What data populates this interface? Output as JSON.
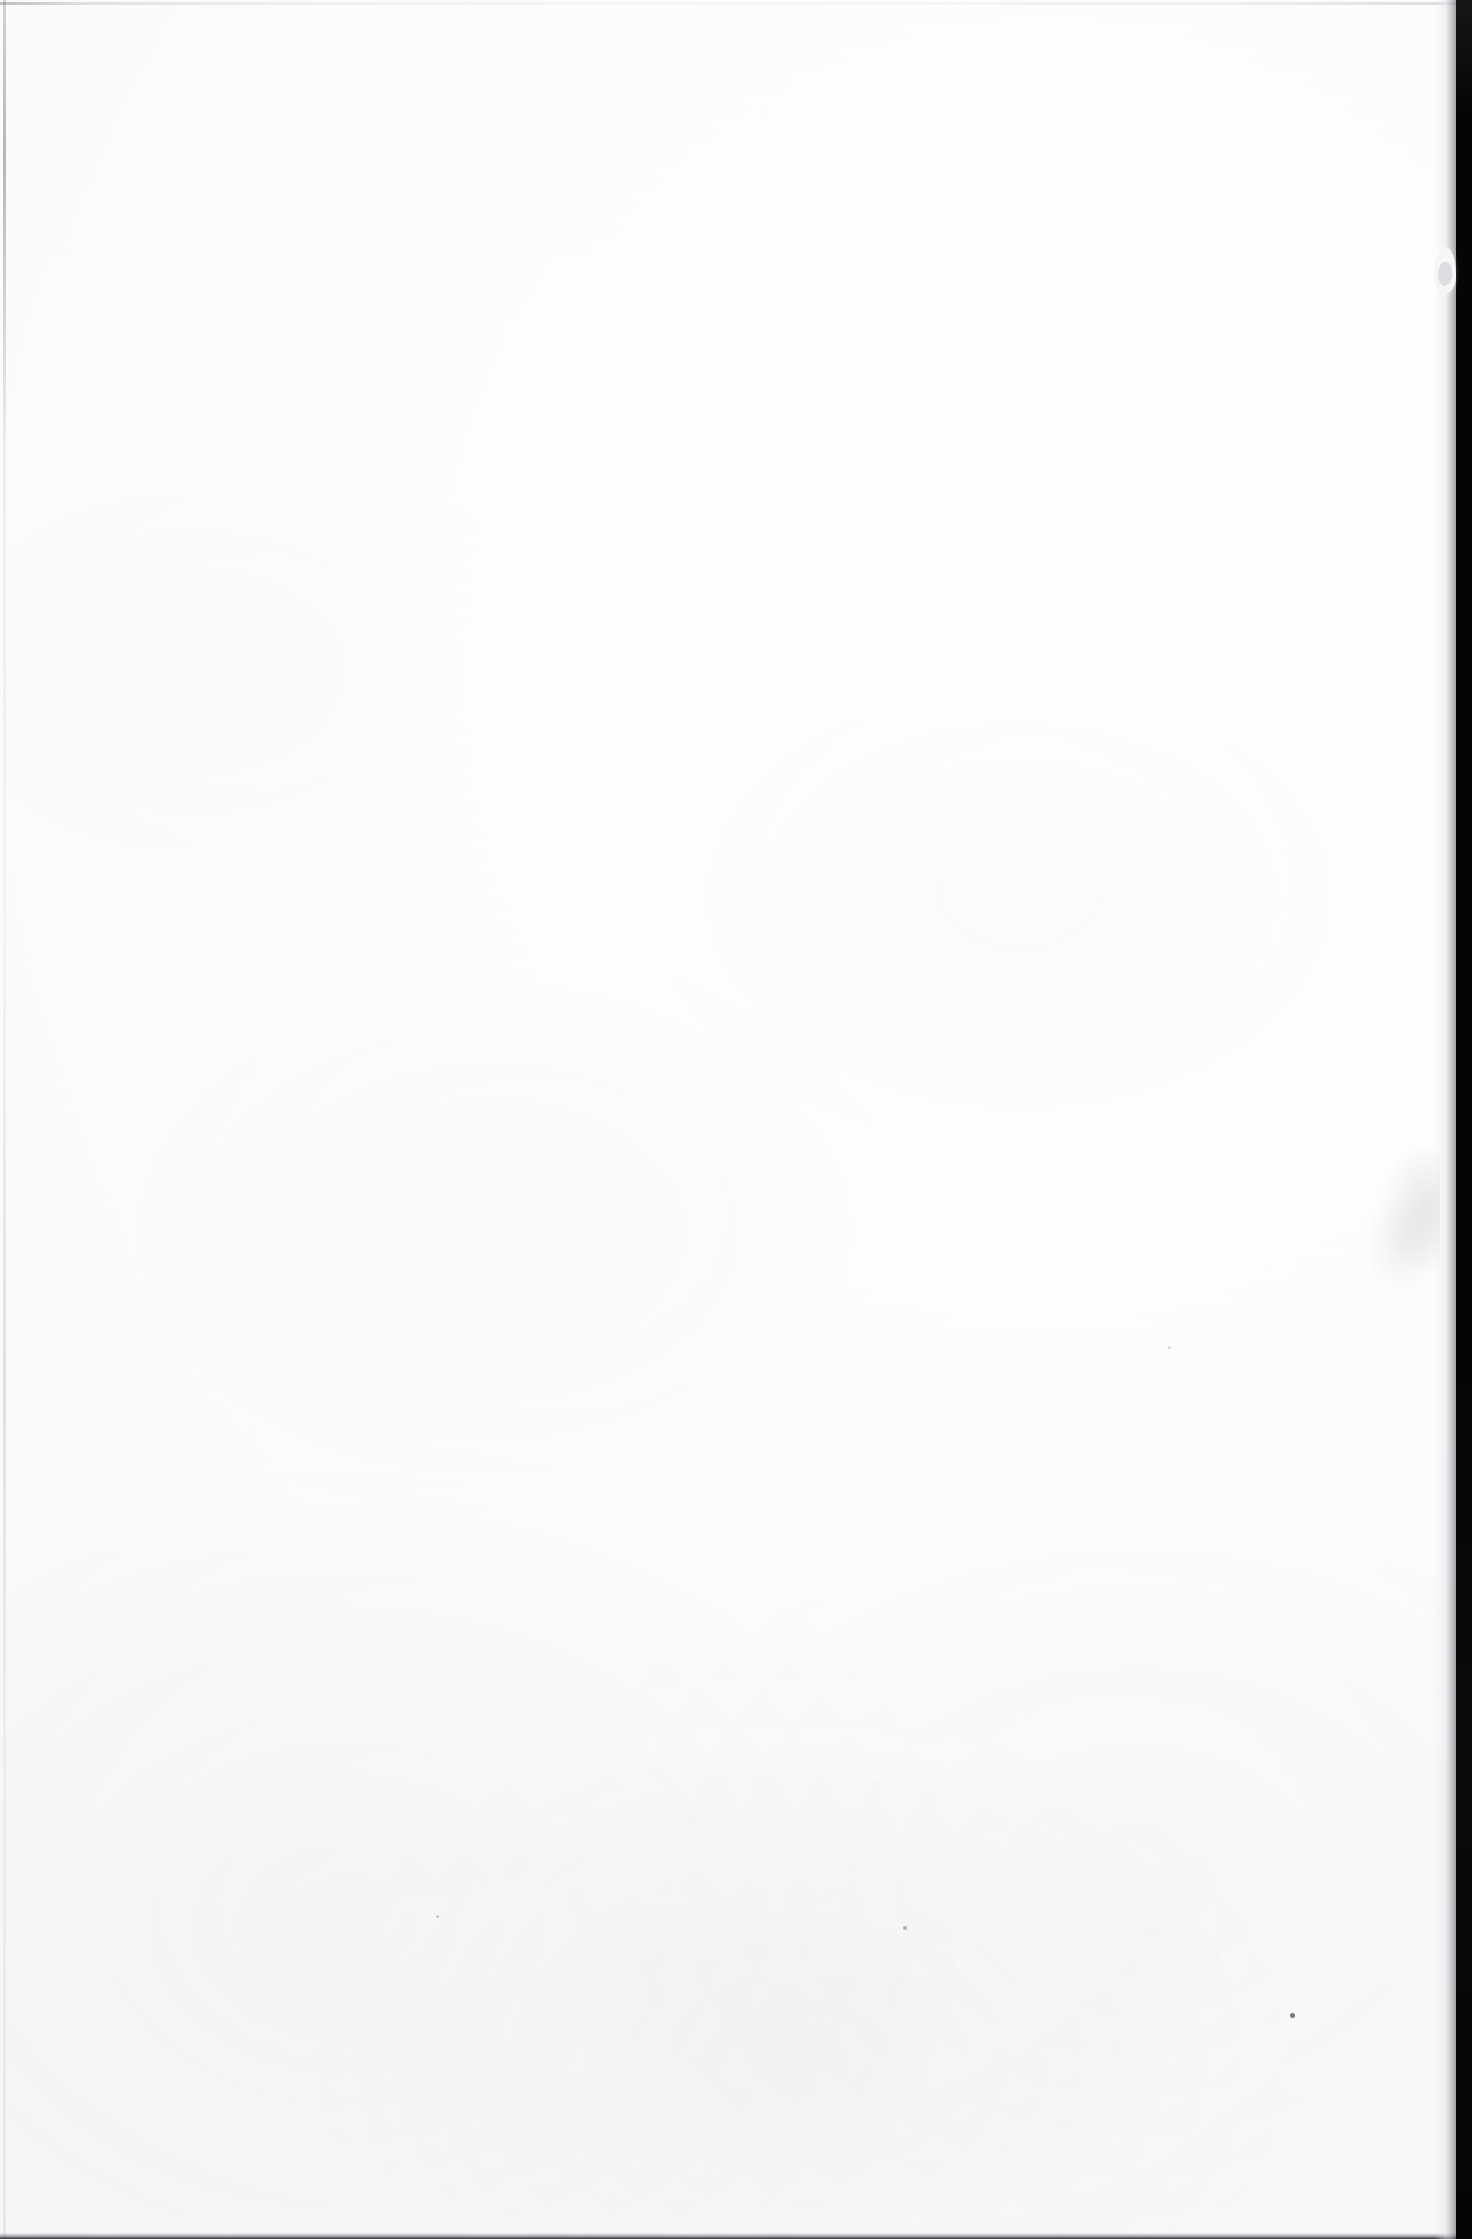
{
  "document": {
    "kind": "scanned-page",
    "page_label": "",
    "visible_text": "",
    "body_text": "",
    "header_text": "",
    "footer_text": "",
    "page_number": "",
    "description": "Blank scanned page"
  },
  "canvas": {
    "width_px": 1472,
    "height_px": 2239
  },
  "paper": {
    "base_color": "#fefefe",
    "tone_color": "#f8f8f9",
    "grain_color": "#f2f2f3",
    "showthrough_color": "#8c8c92"
  },
  "scanner": {
    "void_color": "#050505",
    "void_left_edge_px": 1456,
    "void_width_px": 16
  },
  "edges": {
    "top_line_color": "#6e6e73",
    "left_line_color": "#64646a",
    "bottom_line_color": "#1e1e22",
    "right_edge_color": "#5a5a60"
  },
  "artifacts": {
    "bump_label": "paper edge bump",
    "smudge_label": "edge shadow smudge",
    "speck_label": "dust speck"
  }
}
